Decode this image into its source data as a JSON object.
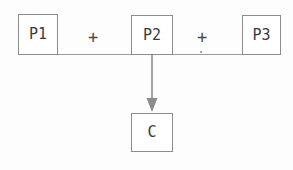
{
  "diagram": {
    "type": "process-reaction-diagram",
    "expression": "P1 + P2 + P3 → C",
    "background_color": "#fdfdfd",
    "stroke_color": "#8c8c8c",
    "text_color": "#3a3a3a",
    "nodes": [
      {
        "id": "p1",
        "label": "P1",
        "role": "reactant"
      },
      {
        "id": "p2",
        "label": "P2",
        "role": "reactant"
      },
      {
        "id": "p3",
        "label": "P3",
        "role": "reactant"
      },
      {
        "id": "c",
        "label": "C",
        "role": "product"
      }
    ],
    "operators": [
      {
        "id": "plus-1",
        "label": "+"
      },
      {
        "id": "plus-2",
        "label": "+"
      }
    ],
    "connectors": [
      {
        "id": "baseline",
        "kind": "horizontal-line",
        "from": "p1",
        "to": "p3"
      },
      {
        "id": "arrow-down",
        "kind": "arrow",
        "from": "p2",
        "to": "c",
        "direction": "down"
      }
    ]
  }
}
